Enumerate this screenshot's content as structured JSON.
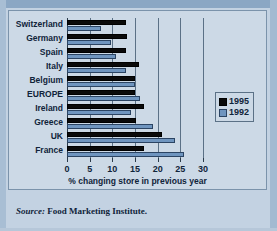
{
  "figure": {
    "source_prefix": "Source:",
    "source_text": "Food Marketing Institute."
  },
  "legend": {
    "position": "right",
    "entries": [
      {
        "label": "1995",
        "color": "#0a0a0a"
      },
      {
        "label": "1992",
        "color": "#6f95bf"
      }
    ]
  },
  "chart_data": {
    "type": "bar",
    "orientation": "horizontal",
    "title": "",
    "subtitle": "",
    "xlabel": "% changing store in previous year",
    "ylabel": "",
    "xlim": [
      0,
      30
    ],
    "xticks": [
      0,
      5,
      10,
      15,
      20,
      25,
      30
    ],
    "xtick_labels": [
      "0",
      "5",
      "10",
      "15",
      "20",
      "25",
      "30"
    ],
    "grid": true,
    "grid_axis": "x",
    "legend_position": "right",
    "categories": [
      "Switzerland",
      "Germany",
      "Spain",
      "Italy",
      "Belgium",
      "EUROPE",
      "Ireland",
      "Greece",
      "UK",
      "France"
    ],
    "series": [
      {
        "name": "1995",
        "color": "#0a0a0a",
        "values": [
          13.0,
          13.2,
          13.0,
          15.8,
          15.0,
          15.0,
          17.0,
          15.2,
          21.0,
          17.0
        ]
      },
      {
        "name": "1992",
        "color": "#6f95bf",
        "values": [
          7.5,
          9.8,
          10.8,
          13.0,
          15.0,
          16.0,
          14.2,
          19.0,
          23.8,
          25.8
        ]
      }
    ]
  }
}
